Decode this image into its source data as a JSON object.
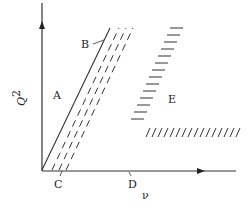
{
  "diagram": {
    "axes": {
      "y_label": "Q",
      "y_label_superscript": "2",
      "x_label": "ν"
    },
    "regions": {
      "A": "A",
      "B": "B",
      "C": "C",
      "D": "D",
      "E": "E"
    },
    "colors": {
      "ink": "#333333",
      "background": "#ffffff"
    }
  }
}
